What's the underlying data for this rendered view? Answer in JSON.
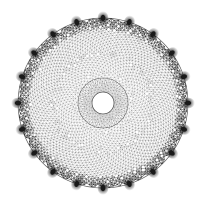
{
  "figure": {
    "title": "Spiral phyllotaxis triangulated annular disk mesh",
    "type": "mesh-diagram",
    "background_color": "#ffffff",
    "line_color": "#4a4a4a",
    "node_color": "#1a1a1a",
    "fill_color": "#ffffff",
    "width": 206,
    "height": 203
  },
  "geometry": {
    "center_x": 103,
    "center_y": 103,
    "outer_radius": 85,
    "inner_hole_radius": 11,
    "fan_ring_radius": 25,
    "boundary_node_count": 20,
    "boundary_node_radius": 3.4,
    "spiral_divergence_angle_deg": 137.508,
    "interior_point_count": 2600,
    "rim_band_inner_radius": 74,
    "edge_line_width": 0.35,
    "fan_line_count": 72
  },
  "chart_data": {
    "type": "scatter",
    "title": "Spiral phyllotaxis triangulated annular disk mesh",
    "subtitle": "",
    "xlabel": "",
    "ylabel": "",
    "grid": false,
    "legend": false,
    "xlim": [
      -85,
      85
    ],
    "ylim": [
      -85,
      85
    ],
    "series": [
      {
        "name": "interior-mesh-nodes",
        "count": 2600,
        "distribution": "vogel-spiral",
        "radius_min": 11,
        "radius_max": 85,
        "marker": "triangulated-edges"
      },
      {
        "name": "inner-hole-boundary",
        "count": 36,
        "distribution": "circular",
        "radius_min": 11,
        "radius_max": 11,
        "marker": "ring"
      },
      {
        "name": "fan-ring-boundary",
        "count": 72,
        "distribution": "circular",
        "radius_min": 25,
        "radius_max": 25,
        "marker": "ring"
      },
      {
        "name": "outer-boundary-nodes",
        "count": 20,
        "distribution": "circular",
        "radius_min": 85,
        "radius_max": 85,
        "marker": "filled-blob"
      }
    ]
  }
}
